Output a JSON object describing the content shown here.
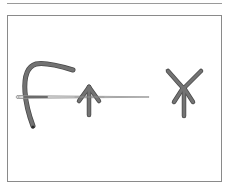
{
  "figure": {
    "colors": {
      "background": "#ffffff",
      "frame": "#8a8a8a",
      "rule": "#9a9a9a",
      "thread": "#6b6b6b",
      "thread_outline": "#4a4a4a",
      "needle": "#b8b8b8",
      "needle_outline": "#7a7a7a",
      "thread_end": "#2a2a2a"
    },
    "elements": [
      {
        "name": "thread",
        "kind": "curved thread strand"
      },
      {
        "name": "needle",
        "kind": "sewing needle"
      },
      {
        "name": "stitch-in-progress",
        "kind": "fly stitch on needle"
      },
      {
        "name": "completed-stitch",
        "kind": "finished crossed stitch"
      }
    ]
  }
}
